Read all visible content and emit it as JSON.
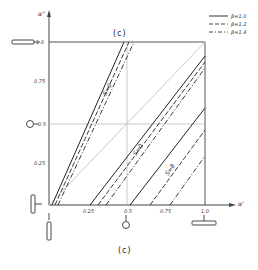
{
  "figure": {
    "top_caption": "(c)",
    "bottom_caption": "(c)"
  },
  "axes": {
    "x_label": "α'",
    "y_label": "α''",
    "x_ticks": [
      "0.25",
      "0.5",
      "0.75",
      "1.0"
    ],
    "y_ticks": [
      "0.25",
      "0.5",
      "0.75",
      "1.0"
    ]
  },
  "legend": {
    "items": [
      {
        "label": "β=1.0",
        "style": "solid"
      },
      {
        "label": "β=1.2",
        "style": "dashed"
      },
      {
        "label": "β=1.4",
        "style": "dash-dot"
      }
    ]
  },
  "curve_labels": [
    "S=0",
    "S=0",
    "S=8"
  ],
  "colors": {
    "line": "#222222",
    "grid": "#bbbbbb",
    "background": "#ffffff"
  }
}
